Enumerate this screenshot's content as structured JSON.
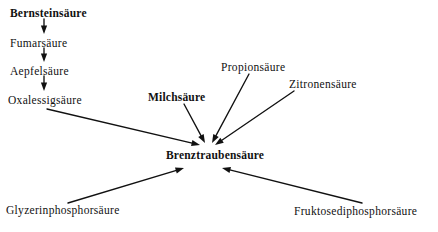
{
  "diagram": {
    "type": "metabolic-pathway",
    "background_color": "#ffffff",
    "ink_color": "#111111",
    "center_node": "Brenztraubensäure",
    "nodes": [
      {
        "id": "bernsteinsaeure",
        "label": "Bernsteinsäure",
        "x": 10,
        "y": 8,
        "weight": "bold"
      },
      {
        "id": "fumarsaeure",
        "label": "Fumarsäure",
        "x": 10,
        "y": 38,
        "weight": "normal"
      },
      {
        "id": "aepfelsaeure",
        "label": "Aepfelsäure",
        "x": 10,
        "y": 66,
        "weight": "normal"
      },
      {
        "id": "oxalessigsaeure",
        "label": "Oxalessigsäure",
        "x": 8,
        "y": 95,
        "weight": "normal"
      },
      {
        "id": "milchsaeure",
        "label": "Milchsäure",
        "x": 148,
        "y": 92,
        "weight": "semi"
      },
      {
        "id": "propionsaeure",
        "label": "Propionsäure",
        "x": 221,
        "y": 62,
        "weight": "normal"
      },
      {
        "id": "zitronensaeure",
        "label": "Zitronensäure",
        "x": 289,
        "y": 79,
        "weight": "normal"
      },
      {
        "id": "brenztraubensaeure",
        "label": "Brenztraubensäure",
        "x": 166,
        "y": 150,
        "weight": "bold"
      },
      {
        "id": "glyzerinphosphorsaeure",
        "label": "Glyzerinphosphorsäure",
        "x": 6,
        "y": 205,
        "weight": "normal"
      },
      {
        "id": "fruktosediphosphorsaeure",
        "label": "Fruktosediphosphorsäure",
        "x": 294,
        "y": 206,
        "weight": "normal"
      }
    ],
    "edges": [
      {
        "id": "edge-bernsteinsaeure-fumarsaeure",
        "from": "bernsteinsaeure",
        "to": "fumarsaeure",
        "x1": 44,
        "y1": 19,
        "x2": 44,
        "y2": 34
      },
      {
        "id": "edge-fumarsaeure-aepfelsaeure",
        "from": "fumarsaeure",
        "to": "aepfelsaeure",
        "x1": 44,
        "y1": 48,
        "x2": 44,
        "y2": 62
      },
      {
        "id": "edge-aepfelsaeure-oxalessigsaeure",
        "from": "aepfelsaeure",
        "to": "oxalessigsaeure",
        "x1": 44,
        "y1": 76,
        "x2": 44,
        "y2": 91
      },
      {
        "id": "edge-oxalessigsaeure-brenztraubensaeure",
        "from": "oxalessigsaeure",
        "to": "brenztraubensaeure",
        "x1": 47,
        "y1": 109,
        "x2": 200,
        "y2": 145
      },
      {
        "id": "edge-milchsaeure-brenztraubensaeure",
        "from": "milchsaeure",
        "to": "brenztraubensaeure",
        "x1": 184,
        "y1": 104,
        "x2": 205,
        "y2": 143
      },
      {
        "id": "edge-propionsaeure-brenztraubensaeure",
        "from": "propionsaeure",
        "to": "brenztraubensaeure",
        "x1": 249,
        "y1": 74,
        "x2": 212,
        "y2": 143
      },
      {
        "id": "edge-zitronensaeure-brenztraubensaeure",
        "from": "zitronensaeure",
        "to": "brenztraubensaeure",
        "x1": 294,
        "y1": 91,
        "x2": 215,
        "y2": 145
      },
      {
        "id": "edge-glyzerinphosphorsaeure-brenztraubensaeure",
        "from": "glyzerinphosphorsaeure",
        "to": "brenztraubensaeure",
        "x1": 68,
        "y1": 203,
        "x2": 184,
        "y2": 168
      },
      {
        "id": "edge-fruktosediphosphorsaeure-brenztraubensaeure",
        "from": "fruktosediphosphorsaeure",
        "to": "brenztraubensaeure",
        "x1": 362,
        "y1": 203,
        "x2": 222,
        "y2": 168
      }
    ]
  }
}
